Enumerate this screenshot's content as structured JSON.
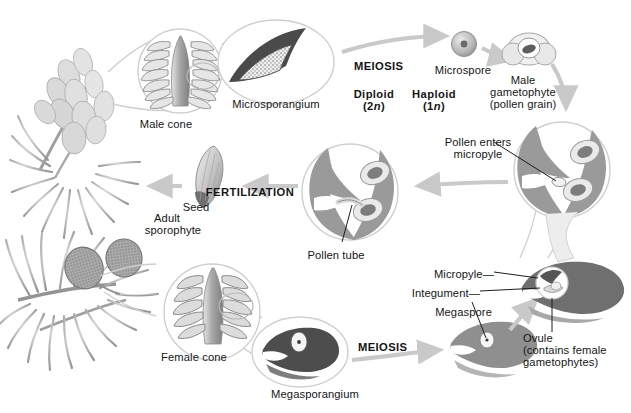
{
  "figure": {
    "background": "#ffffff",
    "ink": "#151515",
    "arrow_color": "#c9c9c9",
    "mid_gray": "#8e8e8e",
    "dark_gray": "#6e6e6e",
    "light_gray": "#d6d6d6",
    "circle_outline": "#cfcfcf"
  },
  "labels": {
    "male_cone": "Male cone",
    "microsporangium": "Microsporangium",
    "meiosis_top": "MEIOSIS",
    "microspore": "Microspore",
    "male_gametophyte_line1": "Male",
    "male_gametophyte_line2": "gametophyte",
    "male_gametophyte_line3": "(pollen grain)",
    "diploid_line1": "Diploid",
    "diploid_line2": "(2n)",
    "haploid_line1": "Haploid",
    "haploid_line2": "(1n)",
    "pollen_enters_line1": "Pollen enters",
    "pollen_enters_line2": "micropyle",
    "fertilization": "FERTILIZATION",
    "seed": "Seed",
    "adult_sporophyte_line1": "Adult",
    "adult_sporophyte_line2": "sporophyte",
    "pollen_tube": "Pollen tube",
    "female_cone": "Female cone",
    "megasporangium": "Megasporangium",
    "meiosis_bottom": "MEIOSIS",
    "megaspore": "Megaspore",
    "integument": "Integument",
    "micropyle": "Micropyle",
    "ovule_line1": "Ovule",
    "ovule_line2": "(contains female",
    "ovule_line3": "gametophytes)"
  },
  "stages": [
    {
      "name": "adult-sporophyte",
      "ploidy": "diploid",
      "label": "Adult sporophyte"
    },
    {
      "name": "male-cone",
      "ploidy": "diploid",
      "label": "Male cone"
    },
    {
      "name": "microsporangium",
      "ploidy": "diploid",
      "label": "Microsporangium"
    },
    {
      "name": "microspore",
      "ploidy": "haploid",
      "label": "Microspore"
    },
    {
      "name": "male-gametophyte",
      "ploidy": "haploid",
      "label": "Male gametophyte (pollen grain)"
    },
    {
      "name": "ovule",
      "ploidy": "haploid",
      "label": "Ovule (contains female gametophytes)"
    },
    {
      "name": "pollen-tube",
      "ploidy": "haploid",
      "label": "Pollen tube"
    },
    {
      "name": "seed",
      "ploidy": "diploid",
      "label": "Seed"
    },
    {
      "name": "female-cone",
      "ploidy": "diploid",
      "label": "Female cone"
    },
    {
      "name": "megasporangium",
      "ploidy": "diploid",
      "label": "Megasporangium"
    },
    {
      "name": "megaspore",
      "ploidy": "haploid",
      "label": "Megaspore"
    }
  ],
  "processes": [
    {
      "name": "meiosis-top",
      "label": "MEIOSIS"
    },
    {
      "name": "meiosis-bottom",
      "label": "MEIOSIS"
    },
    {
      "name": "fertilization",
      "label": "FERTILIZATION"
    }
  ]
}
